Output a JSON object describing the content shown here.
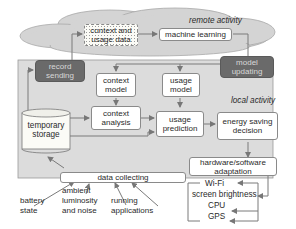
{
  "remote": {
    "label": "remote activity",
    "context_usage_data": "context and usage data",
    "machine_learning": "machine learning"
  },
  "local": {
    "label": "local activity",
    "record_sending": "record sending",
    "model_updating": "model updating",
    "context_model": "context model",
    "usage_model": "usage model",
    "temporary_storage": "temporary storage",
    "context_analysis": "context analysis",
    "usage_prediction": "usage prediction",
    "energy_saving_decision": "energy saving decision",
    "hardware_software_adaptation": "hardware/software adaptation",
    "data_collecting": "data collecting"
  },
  "inputs": {
    "battery_state": "battery state",
    "ambient": "ambient luminosity and noise",
    "running_applications": "running applications"
  },
  "outputs": [
    "Wi-Fi",
    "screen brightness",
    "CPU",
    "GPS"
  ],
  "colors": {
    "cloud": "#d4d4d4",
    "local_panel": "#dcdcdc",
    "dark_box": "#6a6a6a",
    "line": "#7a7a7a"
  }
}
